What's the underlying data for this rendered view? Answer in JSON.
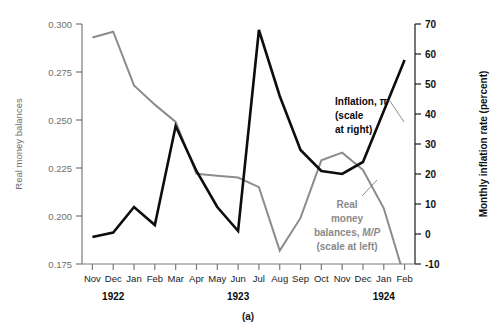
{
  "figure": {
    "caption": "(a)",
    "left_axis_title": "Real money balances",
    "right_axis_title": "Monthly inflation rate (percent)",
    "annotation_black": {
      "line1": "Inflation, π",
      "line2": "(scale",
      "line3": "at right)"
    },
    "annotation_gray": {
      "line1": "Real",
      "line2": "money",
      "line3_a": "balances, ",
      "line3_b": "M/P",
      "line4": "(scale at left)"
    },
    "years": [
      {
        "label": "1922",
        "at_category": "Dec"
      },
      {
        "label": "1923",
        "at_category": "Jun"
      },
      {
        "label": "1924",
        "at_category": "Jan"
      }
    ]
  },
  "colors": {
    "black_series": "#0d0d0d",
    "gray_series": "#8c8c8c",
    "left_axis": "#7a7a7a",
    "right_axis": "#1a1a1a",
    "background": "#ffffff"
  },
  "chart_data": {
    "type": "line",
    "title": "",
    "subtitle": "",
    "xlabel": "",
    "grid": false,
    "legend": "inline-annotations",
    "categories": [
      "Nov",
      "Dec",
      "Jan",
      "Feb",
      "Mar",
      "Apr",
      "May",
      "Jun",
      "Jul",
      "Aug",
      "Sep",
      "Oct",
      "Nov",
      "Dec",
      "Jan",
      "Feb"
    ],
    "category_years": [
      "1922",
      "1922",
      "1923",
      "1923",
      "1923",
      "1923",
      "1923",
      "1923",
      "1923",
      "1923",
      "1923",
      "1923",
      "1923",
      "1923",
      "1924",
      "1924"
    ],
    "left_axis": {
      "label": "Real money balances",
      "ticks": [
        0.175,
        0.2,
        0.225,
        0.25,
        0.275,
        0.3
      ],
      "tick_labels": [
        "0.175",
        "0.200",
        "0.225",
        "0.250",
        "0.275",
        "0.300"
      ],
      "ylim": [
        0.175,
        0.3
      ]
    },
    "right_axis": {
      "label": "Monthly inflation rate (percent)",
      "ticks": [
        -10,
        0,
        10,
        20,
        30,
        40,
        50,
        60,
        70
      ],
      "tick_labels": [
        "-10",
        "0",
        "10",
        "20",
        "30",
        "40",
        "50",
        "60",
        "70"
      ],
      "ylim": [
        -10,
        70
      ]
    },
    "series": [
      {
        "name": "Real money balances, M/P",
        "axis": "left",
        "color": "#8c8c8c",
        "values": [
          0.293,
          0.296,
          0.268,
          0.258,
          0.249,
          0.222,
          0.221,
          0.22,
          0.215,
          0.182,
          0.199,
          0.229,
          0.233,
          0.224,
          0.204,
          0.168
        ]
      },
      {
        "name": "Inflation, π",
        "axis": "right",
        "color": "#0d0d0d",
        "values": [
          -1.0,
          0.5,
          9.0,
          3.0,
          36.0,
          21.0,
          9.0,
          1.0,
          68.0,
          46.0,
          28.0,
          21.0,
          20.0,
          24.0,
          41.0,
          58.0
        ]
      }
    ]
  }
}
